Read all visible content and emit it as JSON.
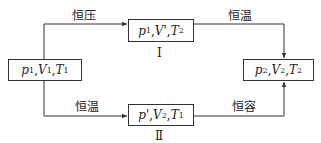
{
  "diagram": {
    "states": {
      "initial": {
        "p": "p",
        "p_sub": "1",
        "V": "V",
        "V_sub": "1",
        "T": "T",
        "T_sub": "1",
        "text": "p1, V1, T1"
      },
      "path1": {
        "p": "p",
        "p_sub": "1",
        "V": "V'",
        "V_sub": "",
        "T": "T",
        "T_sub": "2",
        "text": "p1, V', T2"
      },
      "path2": {
        "p": "p'",
        "p_sub": "",
        "V": "V",
        "V_sub": "2",
        "T": "T",
        "T_sub": "1",
        "text": "p', V2, T1"
      },
      "final": {
        "p": "p",
        "p_sub": "2",
        "V": "V",
        "V_sub": "2",
        "T": "T",
        "T_sub": "2",
        "text": "p2, V2, T2"
      }
    },
    "processes": {
      "top_left": "恒压",
      "top_right": "恒温",
      "bottom_left": "恒温",
      "bottom_right": "恒容"
    },
    "path_labels": {
      "top": "Ⅰ",
      "bottom": "Ⅱ"
    },
    "separator": ", "
  }
}
